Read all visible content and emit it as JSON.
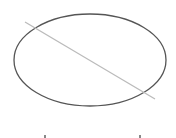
{
  "diagram": {
    "background": "#ffffff",
    "ellipse": {
      "cx": 90,
      "cy": 60,
      "rx": 76,
      "ry": 46,
      "stroke": "#555555",
      "stroke_width": 1.3
    },
    "line": {
      "x1": 25,
      "y1": 22,
      "x2": 155,
      "y2": 99,
      "stroke": "#bbbbbb",
      "stroke_width": 1.3
    },
    "bottom_marks": [
      {
        "x": 44,
        "y": 135
      },
      {
        "x": 139,
        "y": 135
      }
    ]
  }
}
